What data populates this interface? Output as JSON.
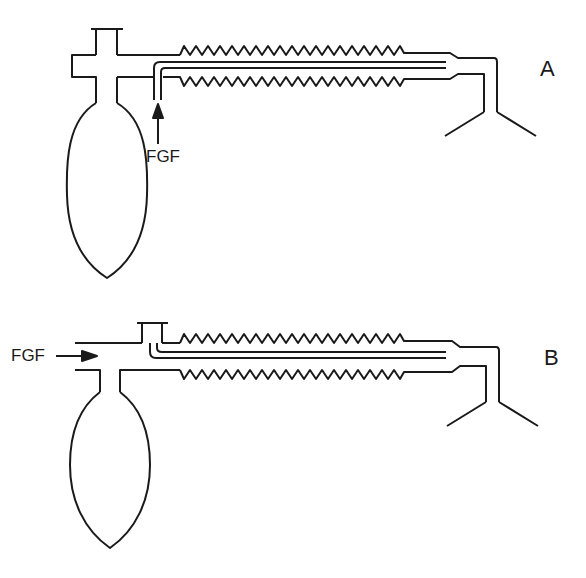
{
  "figure": {
    "panels": [
      {
        "id": "A",
        "label": "A",
        "fgf_label": "FGF",
        "fgf_direction": "up"
      },
      {
        "id": "B",
        "label": "B",
        "fgf_label": "FGF",
        "fgf_direction": "right"
      }
    ]
  },
  "colors": {
    "stroke": "#1a1a1a",
    "background": "#ffffff"
  }
}
